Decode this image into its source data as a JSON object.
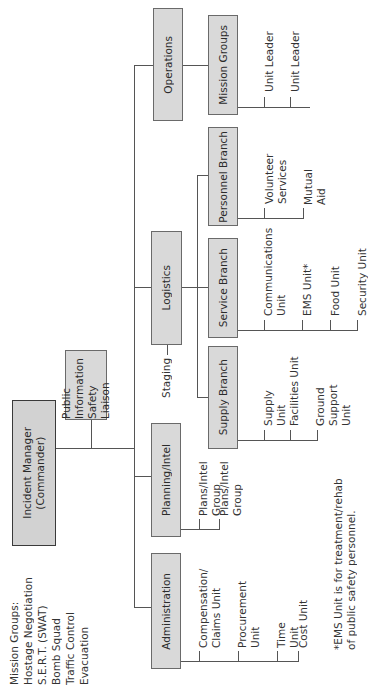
{
  "chart": {
    "orientation": "rotated-90-ccw",
    "colors": {
      "box_fill": "#d9d9d9",
      "line": "#555555",
      "text": "#2b2b2b"
    }
  },
  "commander": {
    "label": "Incident Manager\n(Commander)"
  },
  "mission_groups_list": {
    "heading": "Mission Groups:",
    "items": [
      "Hostage Negotiation",
      "S.E.R.T. (SWAT)",
      "Bomb Squad",
      "Traffic Control",
      "Evacuation"
    ]
  },
  "staff": {
    "label": "Public Information\nSafety\nLiaison"
  },
  "sections": {
    "operations": {
      "label": "Operations",
      "branch": {
        "label": "Mission Groups",
        "units": [
          "Unit Leader",
          "Unit Leader"
        ]
      }
    },
    "logistics": {
      "label": "Logistics",
      "staging": "Staging",
      "branches": {
        "supply": {
          "label": "Supply Branch",
          "units": [
            "Supply Unit",
            "Facilities Unit",
            "Ground Support\nUnit"
          ]
        },
        "service": {
          "label": "Service Branch",
          "units": [
            "Communications\nUnit",
            "EMS Unit*",
            "Food Unit",
            "Security Unit"
          ]
        },
        "personnel": {
          "label": "Personnel Branch",
          "units": [
            "Volunteer\nServices",
            "Mutual\nAid"
          ]
        }
      }
    },
    "planning": {
      "label": "Planning/Intel",
      "units": [
        "Plans/Intel\nGroup",
        "Plans/Intel\nGroup"
      ]
    },
    "administration": {
      "label": "Administration",
      "units": [
        "Compensation/\nClaims Unit",
        "Procurement\nUnit",
        "Time Unit",
        "Cost Unit"
      ]
    }
  },
  "footnote": "*EMS Unit is for treatment/rehab\nof public safety personnel."
}
